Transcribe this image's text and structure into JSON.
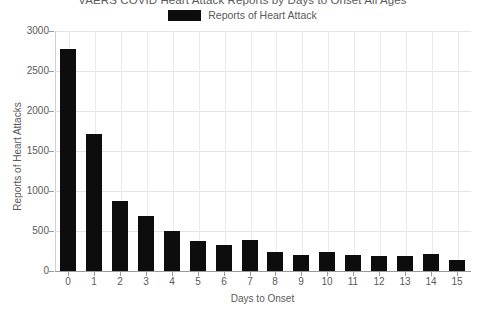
{
  "chart_data": {
    "type": "bar",
    "title": "VAERS COVID Heart Attack Reports by Days to Onset All Ages",
    "xlabel": "Days to Onset",
    "ylabel": "Reports of Heart Attacks",
    "categories": [
      "0",
      "1",
      "2",
      "3",
      "4",
      "5",
      "6",
      "7",
      "8",
      "9",
      "10",
      "11",
      "12",
      "13",
      "14",
      "15"
    ],
    "values": [
      2775,
      1715,
      880,
      690,
      495,
      375,
      320,
      390,
      240,
      205,
      235,
      195,
      190,
      185,
      210,
      140
    ],
    "series": [
      {
        "name": "Reports of Heart Attack",
        "color": "#0d0d0d",
        "values": [
          2775,
          1715,
          880,
          690,
          495,
          375,
          320,
          390,
          240,
          205,
          235,
          195,
          190,
          185,
          210,
          140
        ]
      }
    ],
    "ylim": [
      0,
      3000
    ],
    "yticks": [
      0,
      500,
      1000,
      1500,
      2000,
      2500,
      3000
    ],
    "ytick_labels": [
      "0",
      "500",
      "1000",
      "1500",
      "2000",
      "2500",
      "3000"
    ],
    "grid": true,
    "grid_axis": "both",
    "legend": {
      "position": "top-center",
      "entries": [
        {
          "label": "Reports of Heart Attack",
          "color": "#0d0d0d"
        }
      ]
    },
    "background_color": "#ffffff",
    "text_color": "#5a5a5a",
    "grid_color": "#e3e3e3"
  }
}
